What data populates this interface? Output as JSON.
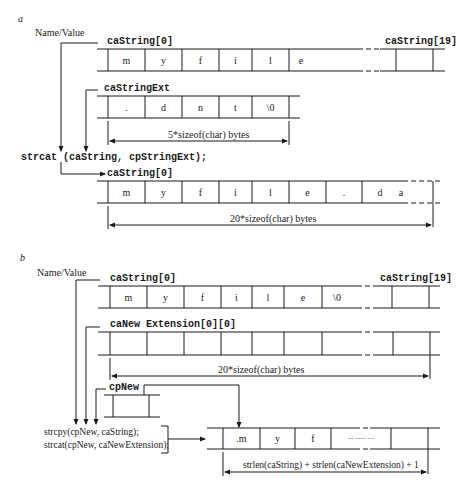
{
  "panel_a": {
    "label": "a",
    "name_value": "Name/Value",
    "caString_first": "caString[0]",
    "caString_last": "caString[19]",
    "caString_cells": [
      "m",
      "y",
      "f",
      "i",
      "l",
      "e",
      "",
      "",
      ""
    ],
    "caStringExt_label": "caStringExt",
    "caStringExt_cells": [
      ".",
      "d",
      "n",
      "t",
      "\\0"
    ],
    "ext_size": "5*sizeof(char) bytes",
    "statement": "strcat (caString, cpStringExt);",
    "result_label": "caString[0]",
    "result_cells": [
      "m",
      "y",
      "f",
      "i",
      "l",
      "e",
      ".",
      "d",
      "a"
    ],
    "result_size": "20*sizeof(char) bytes"
  },
  "panel_b": {
    "label": "b",
    "name_value": "Name/Value",
    "caString_first": "caString[0]",
    "caString_last": "caString[19]",
    "caString_cells": [
      "m",
      "y",
      "f",
      "i",
      "l",
      "e",
      "\\0",
      ""
    ],
    "caNewExt_label": "caNew Extension[0][0]",
    "caNewExt_cells": [
      "",
      "",
      "",
      "",
      "",
      "",
      "",
      ""
    ],
    "ext_size": "20*sizeof(char) bytes",
    "cpNew_label": "cpNew",
    "statement_1": "strcpy(cpNew, caString);",
    "statement_2": "strcat(cpNew, caNewExtension);",
    "new_cells": [
      ".m",
      "y",
      "f",
      "... ...... ....",
      ""
    ],
    "new_size": "strlen(caString) + strlen(caNewExtension) + 1"
  }
}
